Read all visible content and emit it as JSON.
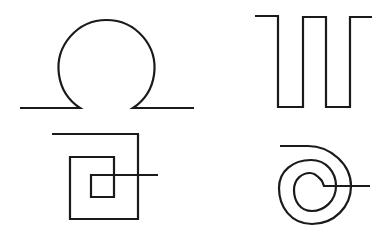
{
  "figure": {
    "background": "#ffffff",
    "stroke_color": "#1a1a1a",
    "stroke_width": 2.2,
    "shapes": [
      {
        "name": "omega-loop",
        "position": "top-left"
      },
      {
        "name": "square-wave",
        "position": "top-right"
      },
      {
        "name": "square-spiral",
        "position": "bottom-left"
      },
      {
        "name": "round-spiral",
        "position": "bottom-right"
      }
    ]
  }
}
